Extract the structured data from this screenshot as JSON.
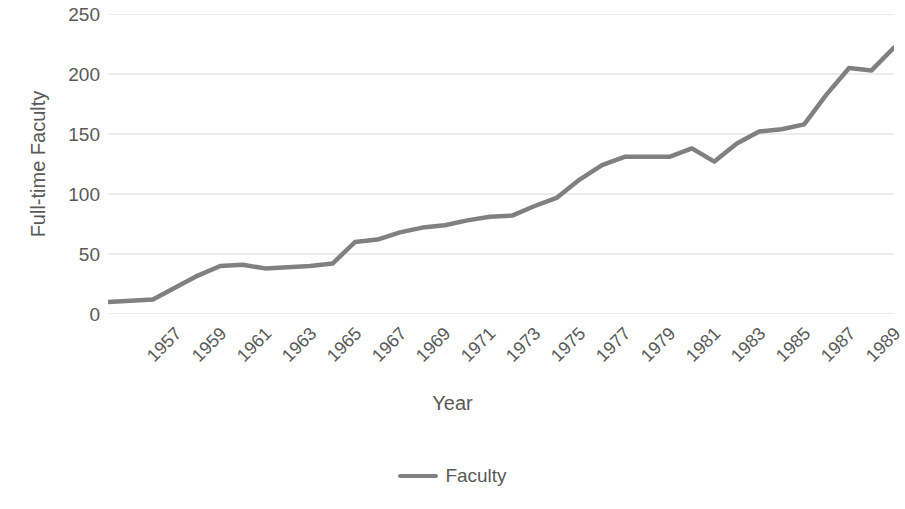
{
  "chart_data": {
    "type": "line",
    "title": "",
    "xlabel": "Year",
    "ylabel": "Full-time Faculty",
    "xlim": [
      1957,
      1992
    ],
    "ylim": [
      0,
      250
    ],
    "y_ticks": [
      250,
      200,
      150,
      100,
      50,
      0
    ],
    "x_tick_labels": [
      "1957",
      "1959",
      "1961",
      "1963",
      "1965",
      "1967",
      "1969",
      "1971",
      "1973",
      "1975",
      "1977",
      "1979",
      "1981",
      "1983",
      "1985",
      "1987",
      "1989",
      "1991"
    ],
    "grid": "horizontal",
    "legend_position": "bottom",
    "series": [
      {
        "name": "Faculty",
        "color": "#808080",
        "x": [
          1957,
          1958,
          1959,
          1960,
          1961,
          1962,
          1963,
          1964,
          1965,
          1966,
          1967,
          1968,
          1969,
          1970,
          1971,
          1972,
          1973,
          1974,
          1975,
          1976,
          1977,
          1978,
          1979,
          1980,
          1981,
          1982,
          1983,
          1984,
          1985,
          1986,
          1987,
          1988,
          1989,
          1990,
          1991,
          1992
        ],
        "values": [
          10,
          11,
          12,
          22,
          32,
          40,
          41,
          38,
          39,
          40,
          42,
          60,
          62,
          68,
          72,
          74,
          78,
          81,
          82,
          90,
          97,
          112,
          124,
          131,
          131,
          131,
          138,
          127,
          142,
          152,
          154,
          158,
          183,
          205,
          203,
          222
        ]
      }
    ]
  },
  "axes": {
    "y_title": "Full-time Faculty",
    "x_title": "Year",
    "y_tick_labels": [
      "250",
      "200",
      "150",
      "100",
      "50",
      "0"
    ]
  },
  "legend": {
    "entries": [
      {
        "label": "Faculty",
        "color": "#808080"
      }
    ]
  },
  "style": {
    "background": "#ffffff",
    "text_color": "#595959",
    "gridline_color": "#d9d9d9",
    "line_color": "#808080"
  }
}
